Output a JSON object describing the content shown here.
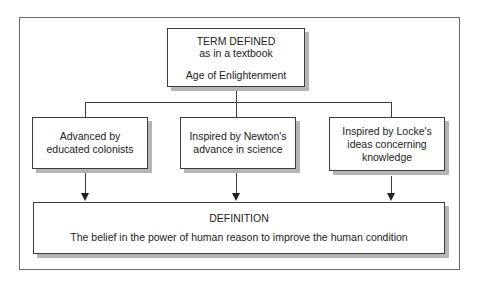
{
  "diagram": {
    "top_box": {
      "heading": "TERM DEFINED",
      "subheading": "as in a textbook",
      "term": "Age of Enlightenment"
    },
    "supporting_boxes": [
      {
        "line1": "Advanced by",
        "line2": "educated colonists",
        "line3": ""
      },
      {
        "line1": "Inspired by Newton's",
        "line2": "advance in science",
        "line3": ""
      },
      {
        "line1": "Inspired by Locke's",
        "line2": "ideas concerning",
        "line3": "knowledge"
      }
    ],
    "definition_box": {
      "heading": "DEFINITION",
      "text": "The belief in the power of human reason to improve the human condition"
    },
    "colors": {
      "border": "#3c3c3c",
      "shadow": "#b5b5b5",
      "frame": "#6a6a6a",
      "text": "#222222"
    }
  }
}
